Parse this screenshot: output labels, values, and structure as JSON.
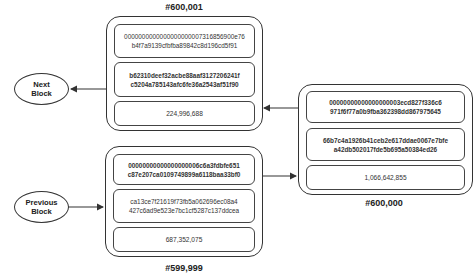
{
  "blocks": {
    "b600001": {
      "label": "#600,001",
      "hash_line1": "0000000000000000000007316856900e76",
      "hash_line2": "b4f7a9139cfbfba89842c8d196cd5f91",
      "merkle_line1": "b62310deef32acbe88aaf3127206241f",
      "merkle_line2": "c5204a785143afc6fe36a2543af51f90",
      "value": "224,996,688"
    },
    "b600000": {
      "label": "#600,000",
      "hash_line1": "00000000000000000003ecd827f336c6",
      "hash_line2": "971f6f77a0b9fba362398dd867975645",
      "merkle_line1": "66b7c4a1926b41ceb2e617ddae0067e7bfe",
      "merkle_line2": "a42db502017fde5b695a50384ed26",
      "value": "1,066,642,855"
    },
    "b599999": {
      "label": "#599,999",
      "hash_line1": "00000000000000000006c6a3fdbfe651",
      "hash_line2": "c87e207ca0109749899a6118baa33bf0",
      "merkle_line1": "ca13ce7f21619f73fb5a062696ec08a4",
      "merkle_line2": "427c6ad9e523e7bc1cf5287c137ddcea",
      "value": "687,352,075"
    }
  },
  "nodes": {
    "next_block": {
      "line1": "Next",
      "line2": "Block"
    },
    "previous_block": {
      "line1": "Previous",
      "line2": "Block"
    }
  },
  "colors": {
    "stroke": "#333333",
    "background": "#ffffff",
    "text": "#222222"
  }
}
